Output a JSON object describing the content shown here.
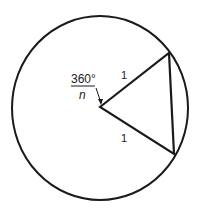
{
  "diagram": {
    "angle_label": {
      "numerator": "360°",
      "denominator": "n"
    },
    "side_labels": [
      "1",
      "1"
    ],
    "colors": {
      "stroke": "#1a1a1a",
      "background": "#ffffff"
    }
  }
}
